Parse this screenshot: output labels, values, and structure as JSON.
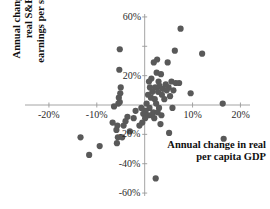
{
  "chart_data": {
    "type": "scatter",
    "title": "",
    "subtitle": "",
    "xlabel": "Annual change in real per capita GDP",
    "ylabel": "Annual change in real S&P 500 earnings per share",
    "xlim": [
      -25,
      22
    ],
    "ylim": [
      -62,
      62
    ],
    "xticks": [
      -20,
      -10,
      0,
      10,
      20
    ],
    "yticks": [
      -60,
      -40,
      -20,
      0,
      20,
      40,
      60
    ],
    "xtick_labels": [
      "-20%",
      "-10%",
      "",
      "10%",
      "20%"
    ],
    "ytick_labels": [
      "-60%",
      "-40%",
      "-20%",
      "",
      "20%",
      "",
      "60%"
    ],
    "grid": false,
    "legend": null,
    "axes_style": "spines-cross-at-zero",
    "marker": {
      "shape": "circle",
      "color": "#595959",
      "size_px": 3.1
    },
    "units": "percent",
    "points": [
      [
        7.5,
        52
      ],
      [
        -5.2,
        38
      ],
      [
        6.3,
        37
      ],
      [
        12.0,
        35
      ],
      [
        2.6,
        31
      ],
      [
        1.9,
        29
      ],
      [
        4.8,
        29
      ],
      [
        -5.3,
        24
      ],
      [
        2.5,
        22
      ],
      [
        3.4,
        21
      ],
      [
        1.4,
        18
      ],
      [
        0.9,
        16
      ],
      [
        2.9,
        16
      ],
      [
        5.6,
        16
      ],
      [
        6.5,
        15
      ],
      [
        7.2,
        15
      ],
      [
        4.4,
        14
      ],
      [
        3.1,
        13
      ],
      [
        1.1,
        12
      ],
      [
        2.2,
        12
      ],
      [
        5.0,
        12
      ],
      [
        -5.0,
        12
      ],
      [
        3.8,
        11
      ],
      [
        4.6,
        10
      ],
      [
        6.0,
        10
      ],
      [
        1.6,
        9
      ],
      [
        2.8,
        9
      ],
      [
        -5.1,
        8
      ],
      [
        9.6,
        8
      ],
      [
        0.7,
        7
      ],
      [
        3.6,
        7
      ],
      [
        5.3,
        6
      ],
      [
        -5.4,
        5
      ],
      [
        1.3,
        5
      ],
      [
        2.1,
        4
      ],
      [
        4.1,
        4
      ],
      [
        -5.2,
        2
      ],
      [
        -5.5,
        1
      ],
      [
        0.4,
        1
      ],
      [
        2.4,
        1
      ],
      [
        16.3,
        1
      ],
      [
        -6.4,
        -1
      ],
      [
        -0.7,
        -2
      ],
      [
        1.0,
        -2
      ],
      [
        3.0,
        -2
      ],
      [
        5.8,
        -2
      ],
      [
        -1.9,
        -4
      ],
      [
        0.2,
        -4
      ],
      [
        1.8,
        -5
      ],
      [
        2.7,
        -5
      ],
      [
        -0.3,
        -6
      ],
      [
        0.8,
        -7
      ],
      [
        1.5,
        -7
      ],
      [
        3.5,
        -7
      ],
      [
        -3.6,
        -8
      ],
      [
        -2.3,
        -9
      ],
      [
        0.1,
        -9
      ],
      [
        2.0,
        -9
      ],
      [
        -4.0,
        -11
      ],
      [
        -6.7,
        -12
      ],
      [
        -0.5,
        -12
      ],
      [
        3.3,
        -13
      ],
      [
        -5.7,
        -14
      ],
      [
        -4.4,
        -14
      ],
      [
        -1.1,
        -14
      ],
      [
        -5.9,
        -17
      ],
      [
        -3.1,
        -18
      ],
      [
        5.1,
        -19
      ],
      [
        -13.4,
        -22
      ],
      [
        -5.6,
        -22
      ],
      [
        -4.7,
        -22
      ],
      [
        16.5,
        -23
      ],
      [
        -5.8,
        -26
      ],
      [
        -9.4,
        -28
      ],
      [
        -11.6,
        -34
      ],
      [
        2.3,
        -50
      ]
    ]
  }
}
